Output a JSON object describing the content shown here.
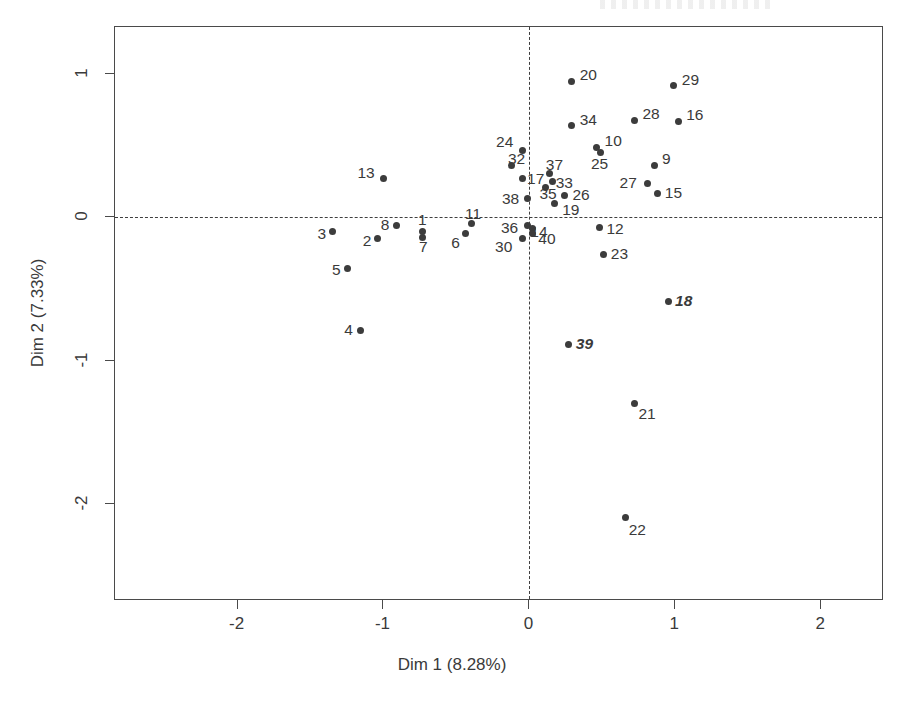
{
  "chart_data": {
    "type": "scatter",
    "title": "",
    "xlabel": "Dim 1 (8.28%)",
    "ylabel": "Dim 2 (7.33%)",
    "xlim": [
      -2.84,
      2.43
    ],
    "ylim": [
      -2.68,
      1.33
    ],
    "xticks": [
      -2,
      -1,
      0,
      1,
      2
    ],
    "xticklabels": [
      "-2",
      "-1",
      "0",
      "1",
      "2"
    ],
    "yticks": [
      1,
      0,
      -1,
      -2
    ],
    "yticklabels": [
      "1",
      "0",
      "-1",
      "-2"
    ],
    "grid": false,
    "legend": null,
    "reference_lines": {
      "vertical_x": 0,
      "horizontal_y": 0,
      "style": "dashed"
    },
    "point_color": "#3c3c3c",
    "frame_color": "#4a4a4a",
    "points": [
      {
        "label": "20",
        "x": 0.29,
        "y": 0.95,
        "lx": 8,
        "ly": -14,
        "italic": false
      },
      {
        "label": "29",
        "x": 0.99,
        "y": 0.92,
        "lx": 8,
        "ly": -14,
        "italic": false
      },
      {
        "label": "34",
        "x": 0.29,
        "y": 0.64,
        "lx": 8,
        "ly": -14,
        "italic": false
      },
      {
        "label": "28",
        "x": 0.72,
        "y": 0.68,
        "lx": 8,
        "ly": -14,
        "italic": false
      },
      {
        "label": "16",
        "x": 1.02,
        "y": 0.67,
        "lx": 8,
        "ly": -14,
        "italic": false
      },
      {
        "label": "10",
        "x": 0.46,
        "y": 0.49,
        "lx": 8,
        "ly": -14,
        "italic": false
      },
      {
        "label": "24",
        "x": -0.05,
        "y": 0.47,
        "lx": -26,
        "ly": -16,
        "italic": false
      },
      {
        "label": "9",
        "x": 0.86,
        "y": 0.36,
        "lx": 7,
        "ly": -15,
        "italic": false
      },
      {
        "label": "32",
        "x": -0.12,
        "y": 0.36,
        "lx": -4,
        "ly": -15,
        "italic": false
      },
      {
        "label": "25",
        "x": 0.49,
        "y": 0.45,
        "lx": -10,
        "ly": 3,
        "italic": false
      },
      {
        "label": "37",
        "x": 0.14,
        "y": 0.31,
        "lx": -4,
        "ly": -16,
        "italic": false
      },
      {
        "label": "13",
        "x": -1.0,
        "y": 0.27,
        "lx": -26,
        "ly": -14,
        "italic": false
      },
      {
        "label": "17",
        "x": -0.05,
        "y": 0.27,
        "lx": 5,
        "ly": -8,
        "italic": false
      },
      {
        "label": "33",
        "x": 0.16,
        "y": 0.25,
        "lx": 3,
        "ly": -7,
        "italic": false
      },
      {
        "label": "27",
        "x": 0.81,
        "y": 0.24,
        "lx": -28,
        "ly": -8,
        "italic": false
      },
      {
        "label": "35",
        "x": 0.11,
        "y": 0.21,
        "lx": -6,
        "ly": -1,
        "italic": false
      },
      {
        "label": "15",
        "x": 0.88,
        "y": 0.17,
        "lx": 7,
        "ly": -8,
        "italic": false
      },
      {
        "label": "26",
        "x": 0.24,
        "y": 0.15,
        "lx": 8,
        "ly": -9,
        "italic": false
      },
      {
        "label": "38",
        "x": -0.01,
        "y": 0.13,
        "lx": -26,
        "ly": -8,
        "italic": false
      },
      {
        "label": "19",
        "x": 0.17,
        "y": 0.1,
        "lx": 8,
        "ly": -1,
        "italic": false
      },
      {
        "label": "11",
        "x": -0.4,
        "y": -0.04,
        "lx": -6,
        "ly": -17,
        "italic": false
      },
      {
        "label": "8",
        "x": -0.91,
        "y": -0.06,
        "lx": -16,
        "ly": -9,
        "italic": false
      },
      {
        "label": "36",
        "x": -0.01,
        "y": -0.06,
        "lx": -27,
        "ly": -6,
        "italic": false
      },
      {
        "label": "14",
        "x": 0.02,
        "y": -0.08,
        "lx": -2,
        "ly": -5,
        "italic": false
      },
      {
        "label": "1",
        "x": -0.73,
        "y": -0.1,
        "lx": -5,
        "ly": -20,
        "italic": false
      },
      {
        "label": "3",
        "x": -1.35,
        "y": -0.1,
        "lx": -15,
        "ly": -6,
        "italic": false
      },
      {
        "label": "12",
        "x": 0.48,
        "y": -0.07,
        "lx": 7,
        "ly": -6,
        "italic": false
      },
      {
        "label": "6",
        "x": -0.44,
        "y": -0.11,
        "lx": -14,
        "ly": 2,
        "italic": false
      },
      {
        "label": "40",
        "x": 0.02,
        "y": -0.11,
        "lx": 6,
        "ly": -2,
        "italic": false
      },
      {
        "label": "2",
        "x": -1.04,
        "y": -0.15,
        "lx": -15,
        "ly": -6,
        "italic": false
      },
      {
        "label": "7",
        "x": -0.73,
        "y": -0.14,
        "lx": -4,
        "ly": 2,
        "italic": false
      },
      {
        "label": "30",
        "x": -0.05,
        "y": -0.15,
        "lx": -27,
        "ly": 0,
        "italic": false
      },
      {
        "label": "23",
        "x": 0.51,
        "y": -0.26,
        "lx": 7,
        "ly": -9,
        "italic": false
      },
      {
        "label": "5",
        "x": -1.25,
        "y": -0.36,
        "lx": -15,
        "ly": -7,
        "italic": false
      },
      {
        "label": "18",
        "x": 0.95,
        "y": -0.59,
        "lx": 7,
        "ly": -9,
        "italic": true
      },
      {
        "label": "4",
        "x": -1.16,
        "y": -0.79,
        "lx": -16,
        "ly": -8,
        "italic": false
      },
      {
        "label": "39",
        "x": 0.27,
        "y": -0.89,
        "lx": 7,
        "ly": -9,
        "italic": true
      },
      {
        "label": "21",
        "x": 0.72,
        "y": -1.3,
        "lx": 4,
        "ly": 3,
        "italic": false
      },
      {
        "label": "22",
        "x": 0.66,
        "y": -2.1,
        "lx": 3,
        "ly": 4,
        "italic": false
      }
    ]
  }
}
